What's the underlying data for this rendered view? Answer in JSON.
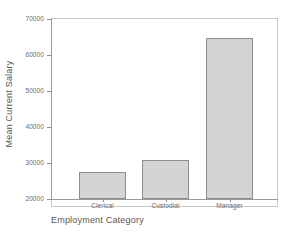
{
  "chart_data": {
    "type": "bar",
    "title": "",
    "categories": [
      "Clerical",
      "Custodial",
      "Manager"
    ],
    "values": [
      27500,
      30900,
      64700
    ],
    "xlabel": "Employment Category",
    "ylabel": "Mean Current Salary",
    "ylim": [
      20000,
      70000
    ],
    "yticks": [
      20000,
      30000,
      40000,
      50000,
      60000,
      70000
    ],
    "ytick_labels": [
      "20000",
      "30000",
      "40000",
      "50000",
      "60000",
      "70000"
    ],
    "grid": false,
    "legend": false,
    "bar_fill_color": "#d4d4d4",
    "bar_border_color": "#8d8d8d",
    "axis_color": "#9a9a9a",
    "frame_color": "#c9c9c9",
    "background_color": "#ffffff",
    "text_color": "#6a6a6a"
  },
  "axes": {
    "y_title": "Mean Current Salary",
    "x_title": "Employment Category"
  }
}
